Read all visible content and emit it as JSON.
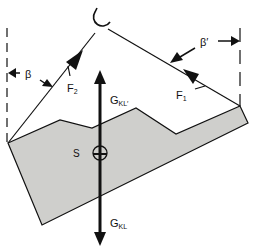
{
  "diagram": {
    "type": "force diagram: suspended load with two rope forces",
    "colors": {
      "load_fill": "#cfcfcc",
      "stroke": "#111111",
      "background": "#ffffff"
    },
    "labels": {
      "beta_left": "β",
      "beta_right": "β′",
      "force_left_main": "F",
      "force_left_sub": "2",
      "force_right_main": "F",
      "force_right_sub": "1",
      "gravity_up_main": "G",
      "gravity_up_sub": "KL′",
      "gravity_down_main": "G",
      "gravity_down_sub": "KL",
      "center_of_gravity": "S"
    },
    "elements": [
      {
        "name": "hook",
        "description": "crane hook at top"
      },
      {
        "name": "rope-left",
        "force": "F2",
        "angle": "β"
      },
      {
        "name": "rope-right",
        "force": "F1",
        "angle": "β′"
      },
      {
        "name": "load-body",
        "description": "shaded irregular load"
      },
      {
        "name": "gravity-vector",
        "description": "vertical weight force through S"
      }
    ]
  }
}
